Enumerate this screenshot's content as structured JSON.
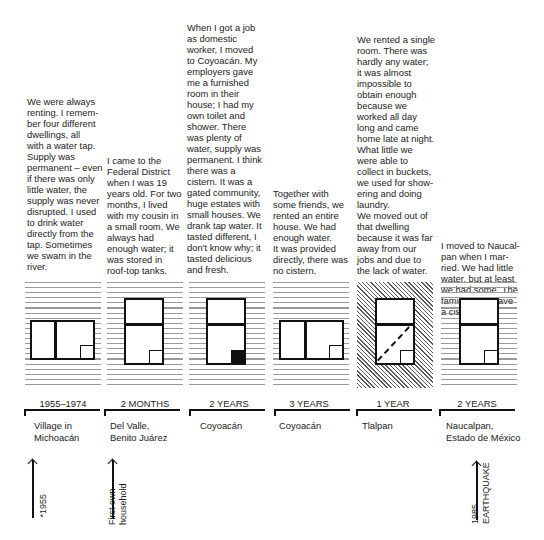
{
  "columns": [
    {
      "story": "We were always\nrenting. I remem-\nber four different\ndwellings, all\nwith a water tap.\nSupply was\npermanent – even\nif there was only\nlittle water, the\nsupply was never\ndisrupted. I used\nto drink water\ndirectly from the\ntap. Sometimes\nwe swam in the\nriver.",
      "duration": "1955–1974",
      "place": "Village in\nMichoacán",
      "window": "horizontal-two-pane",
      "background": "stripes"
    },
    {
      "story": "I came to the\nFederal District\nwhen I was 19\nyears old. For two\nmonths, I lived\nwith my cousin in\na small room. We\nalways had\nenough water; it\nwas stored in\nroof-top tanks.",
      "duration": "2 MONTHS",
      "place": "Del Valle,\nBenito Juárez",
      "window": "vertical-two-pane",
      "background": "stripes"
    },
    {
      "story": "When I got a job\nas domestic\nworker, I moved\nto Coyoacán. My\nemployers gave\nme a furnished\nroom in their\nhouse; I had my\nown toilet and\nshower. There\nwas plenty of\nwater, supply was\npermanent. I think\nthere was a\ncistern. It was a\ngated community,\nhuge estates with\nsmall houses. We\ndrank tap water. It\ntasted different, I\ndon't know why; it\ntasted delicious\nand fresh.",
      "duration": "2 YEARS",
      "place": "Coyoacán",
      "window": "vertical-two-pane-filled",
      "background": "stripes"
    },
    {
      "story": "Together with\nsome friends, we\nrented an entire\nhouse. We had\nenough water.\nIt was provided\ndirectly, there was\nno cistern.",
      "duration": "3 YEARS",
      "place": "Coyoacán",
      "window": "horizontal-two-pane",
      "background": "stripes"
    },
    {
      "story": "We rented a single\nroom. There was\nhardly any water;\nit was almost\nimpossible to\nobtain enough\nbecause we\nworked all day\nlong and came\nhome late at night.\nWhat little we\nwere able to\ncollect in buckets,\nwe used for show-\nering and doing\nlaundry.\nWe moved out of\nthat dwelling\nbecause it was far\naway from our\njobs and due to\nthe lack of water.",
      "duration": "1 YEAR",
      "place": "Tlalpan",
      "window": "vertical-two-pane-dashed",
      "background": "hatch"
    },
    {
      "story": "I moved to Naucal-\npan when I mar-\nried. We had little\nwater, but at least\nwe had some. The\nfamily didn't have\na cistern yet.",
      "duration": "2 YEARS",
      "place": "Naucalpan,\nEstado de México",
      "window": "vertical-two-pane",
      "background": "stripes"
    }
  ],
  "markers": [
    {
      "label": "*1955"
    },
    {
      "label": "First own\nhousehold"
    },
    {
      "label": "1985\nEARTHQUAKE"
    }
  ]
}
